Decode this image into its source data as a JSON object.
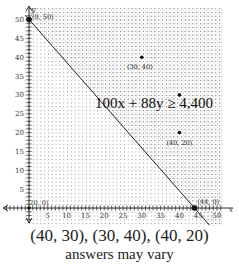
{
  "chart_data": {
    "type": "scatter",
    "title": "",
    "xlabel": "x",
    "ylabel": "y",
    "xlim": [
      -6,
      52
    ],
    "ylim": [
      -7,
      53
    ],
    "xticks": [
      5,
      10,
      15,
      20,
      25,
      30,
      35,
      40,
      45,
      50
    ],
    "yticks": [
      5,
      10,
      15,
      20,
      25,
      30,
      35,
      40,
      45,
      50
    ],
    "grid": true,
    "boundary_line": {
      "equation": "100x + 88y = 4,400",
      "points": [
        [
          0,
          50
        ],
        [
          44,
          0
        ]
      ],
      "style": "solid"
    },
    "shaded_region": "above line (100x + 88y ≥ 4,400)",
    "inequality_label": "100x + 88y ≥ 4,400",
    "points": [
      {
        "x": 0,
        "y": 50,
        "label": "(0, 50)"
      },
      {
        "x": 44,
        "y": 0,
        "label": "(44, 0)"
      },
      {
        "x": 0,
        "y": 0,
        "label": "(0, 0)"
      },
      {
        "x": 30,
        "y": 40,
        "label": "(30, 40)"
      },
      {
        "x": 40,
        "y": 30,
        "label": ""
      },
      {
        "x": 40,
        "y": 20,
        "label": "(40, 20)"
      }
    ]
  },
  "caption": {
    "answer": "(40, 30), (30, 40), (40, 20)",
    "note": "answers may vary"
  }
}
